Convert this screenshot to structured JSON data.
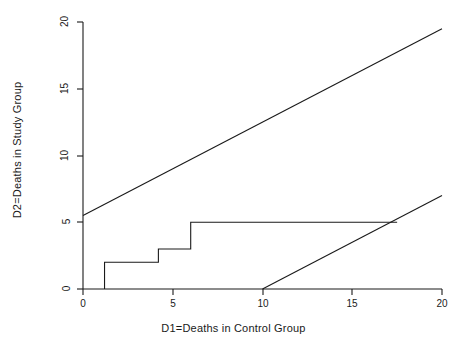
{
  "chart_data": {
    "type": "line",
    "title": "",
    "xlabel": "D1=Deaths in Control Group",
    "ylabel": "D2=Deaths in Study Group",
    "xlim": [
      0,
      20
    ],
    "ylim": [
      0,
      20
    ],
    "xticks": [
      0,
      5,
      10,
      15,
      20
    ],
    "yticks": [
      0,
      5,
      10,
      15,
      20
    ],
    "xtick_labels": [
      "0",
      "5",
      "10",
      "15",
      "20"
    ],
    "ytick_labels": [
      "0",
      "5",
      "10",
      "15",
      "20"
    ],
    "grid": false,
    "legend": "none",
    "series": [
      {
        "name": "upper-boundary-line",
        "type": "line",
        "points": [
          [
            0,
            5.5
          ],
          [
            20,
            19.5
          ]
        ]
      },
      {
        "name": "lower-boundary-line",
        "type": "line",
        "points": [
          [
            10,
            0
          ],
          [
            20,
            7.0
          ]
        ]
      },
      {
        "name": "step-function",
        "type": "step",
        "points": [
          [
            1.2,
            0
          ],
          [
            1.2,
            2.0
          ],
          [
            4.2,
            2.0
          ],
          [
            4.2,
            3.0
          ],
          [
            6.0,
            3.0
          ],
          [
            6.0,
            5.0
          ],
          [
            17.5,
            5.0
          ]
        ]
      }
    ]
  },
  "axes": {
    "x_title": "D1=Deaths in Control Group",
    "y_title": "D2=Deaths in Study Group",
    "x_labels": [
      "0",
      "5",
      "10",
      "15",
      "20"
    ],
    "y_labels": [
      "0",
      "5",
      "10",
      "15",
      "20"
    ]
  },
  "colors": {
    "line": "#1a1a1a",
    "axis": "#1a1a1a",
    "background": "#ffffff"
  }
}
